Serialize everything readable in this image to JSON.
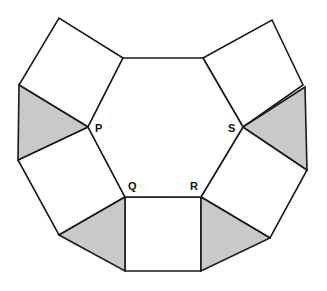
{
  "figure": {
    "background_color": "#ffffff",
    "stroke_color": "#1a1a1a",
    "stroke_width": 1.6,
    "fill_white": "#ffffff",
    "fill_shaded": "#c9c9c9",
    "canvas": {
      "width": 327,
      "height": 291
    }
  },
  "vertices": {
    "hex_top_left": {
      "name": "hex-top-left",
      "x": 123,
      "y": 58
    },
    "hex_top_right": {
      "name": "hex-top-right",
      "x": 203,
      "y": 58
    },
    "S": {
      "name": "S",
      "x": 243,
      "y": 127
    },
    "R": {
      "name": "R",
      "x": 201,
      "y": 197
    },
    "Q": {
      "name": "Q",
      "x": 125,
      "y": 197
    },
    "P": {
      "name": "P",
      "x": 88,
      "y": 127
    },
    "outer_tl_square_top": {
      "name": "outer-top-left-square-top-corner",
      "x": 59,
      "y": 18
    },
    "outer_tl_square_left": {
      "name": "outer-top-left-square-left-corner",
      "x": 19,
      "y": 85
    },
    "outer_left_tri_bottom": {
      "name": "outer-left-triangle-bottom-corner",
      "x": 18,
      "y": 160
    },
    "outer_bl_square_bottom": {
      "name": "outer-bottom-left-square-bottom-corner",
      "x": 59,
      "y": 235
    },
    "bottom_sq_left": {
      "name": "bottom-square-bottom-left",
      "x": 125,
      "y": 271
    },
    "bottom_sq_right": {
      "name": "bottom-square-bottom-right",
      "x": 201,
      "y": 271
    },
    "outer_br_tri_right": {
      "name": "outer-bottom-right-triangle-right-corner",
      "x": 270,
      "y": 238
    },
    "outer_br_square_bottom": {
      "name": "outer-bottom-right-square-bottom-corner",
      "x": 307,
      "y": 170
    },
    "outer_right_tri_top": {
      "name": "outer-right-triangle-top-corner",
      "x": 305,
      "y": 87
    },
    "outer_tr_square_right": {
      "name": "outer-top-right-square-right-corner",
      "x": 303,
      "y": 85
    },
    "outer_tr_square_top": {
      "name": "outer-top-right-square-top-corner",
      "x": 272,
      "y": 20
    }
  },
  "shapes": {
    "hexagon": {
      "label": "central-hexagon",
      "fill": "#ffffff",
      "points": "123,58 203,58 243,127 201,197 125,197 88,127"
    },
    "square_top_left": {
      "label": "square-top-left",
      "fill": "#ffffff",
      "points": "123,58 59,18 19,85 88,127"
    },
    "triangle_left": {
      "label": "triangle-left-shaded",
      "fill": "#c9c9c9",
      "points": "19,85 18,160 88,127"
    },
    "square_bottom_left": {
      "label": "square-bottom-left",
      "fill": "#ffffff",
      "points": "88,127 18,160 59,235 125,197"
    },
    "triangle_bottom_left": {
      "label": "triangle-bottom-left-shaded",
      "fill": "#c9c9c9",
      "points": "59,235 125,271 125,197"
    },
    "square_bottom": {
      "label": "square-bottom-center",
      "fill": "#ffffff",
      "points": "125,197 201,197 201,271 125,271"
    },
    "triangle_bottom_right": {
      "label": "triangle-bottom-right-shaded",
      "fill": "#c9c9c9",
      "points": "201,197 270,238 201,271"
    },
    "square_bottom_right": {
      "label": "square-bottom-right",
      "fill": "#ffffff",
      "points": "201,197 243,127 307,170 270,238"
    },
    "triangle_right": {
      "label": "triangle-right-shaded",
      "fill": "#c9c9c9",
      "points": "243,127 305,87 307,170"
    },
    "square_top_right": {
      "label": "square-top-right",
      "fill": "#ffffff",
      "points": "203,58 272,20 303,85 243,127"
    }
  },
  "labels": [
    {
      "text": "P",
      "x": 95,
      "y": 132,
      "name": "vertex-label-p"
    },
    {
      "text": "S",
      "x": 228,
      "y": 132,
      "name": "vertex-label-s"
    },
    {
      "text": "Q",
      "x": 128,
      "y": 190,
      "name": "vertex-label-q"
    },
    {
      "text": "R",
      "x": 190,
      "y": 190,
      "name": "vertex-label-r"
    }
  ]
}
